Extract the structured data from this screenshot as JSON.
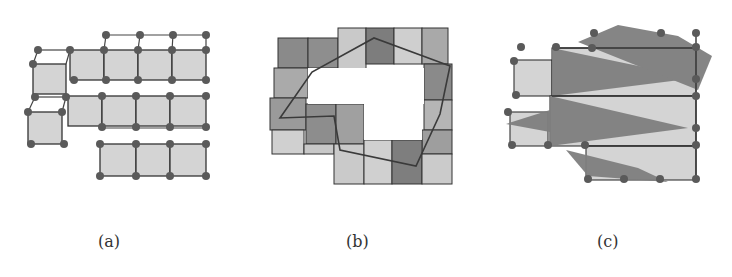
{
  "figure": {
    "panels": [
      {
        "id": "a",
        "caption": "(a)",
        "description": "grid of cells with vertex nodes"
      },
      {
        "id": "b",
        "caption": "(b)",
        "description": "shaded cell ring with overlaid polygon"
      },
      {
        "id": "c",
        "caption": "(c)",
        "description": "grid with overlapping triangular regions"
      }
    ],
    "colors": {
      "cell_light": "#d4d4d4",
      "cell_mid": "#a9a9a9",
      "cell_dark": "#7d7d7d",
      "edge": "#333333",
      "node": "#5a5a5a",
      "triangle": "#7f7f7f"
    }
  }
}
